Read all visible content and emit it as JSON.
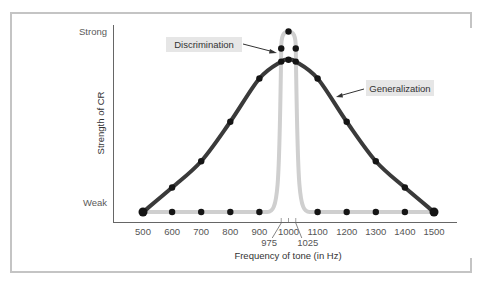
{
  "chart_data": {
    "type": "line",
    "title": "",
    "xlabel": "Frequency of tone (in Hz)",
    "ylabel": "Strength of CR",
    "y_tick_labels": [
      "Weak",
      "Strong"
    ],
    "x_ticks": [
      500,
      600,
      700,
      800,
      900,
      1000,
      1100,
      1200,
      1300,
      1400,
      1500
    ],
    "x_extra_ticks": [
      975,
      1025
    ],
    "xlim": [
      500,
      1500
    ],
    "ylim": [
      0,
      1
    ],
    "grid": false,
    "legend": "inline annotations",
    "series": [
      {
        "name": "Generalization",
        "color": "#3a3a3a",
        "x": [
          500,
          600,
          700,
          800,
          900,
          975,
          1000,
          1025,
          1100,
          1200,
          1300,
          1400,
          1500
        ],
        "values": [
          0.0,
          0.13,
          0.27,
          0.48,
          0.71,
          0.8,
          0.81,
          0.8,
          0.71,
          0.48,
          0.27,
          0.13,
          0.0
        ]
      },
      {
        "name": "Discrimination",
        "color": "#c8c8c8",
        "x": [
          500,
          600,
          700,
          800,
          900,
          975,
          1000,
          1025,
          1100,
          1200,
          1300,
          1400,
          1500
        ],
        "values": [
          0.0,
          0.0,
          0.0,
          0.0,
          0.0,
          0.87,
          0.96,
          0.87,
          0.0,
          0.0,
          0.0,
          0.0,
          0.0
        ]
      }
    ],
    "annotations": [
      {
        "text": "Discrimination",
        "points_to": [
          975,
          0.87
        ]
      },
      {
        "text": "Generalization",
        "points_to": [
          1150,
          0.6
        ]
      }
    ]
  },
  "labels": {
    "strong": "Strong",
    "weak": "Weak",
    "ylabel": "Strength of CR",
    "xlabel": "Frequency of tone (in Hz)",
    "discrimination": "Discrimination",
    "generalization": "Generalization"
  }
}
